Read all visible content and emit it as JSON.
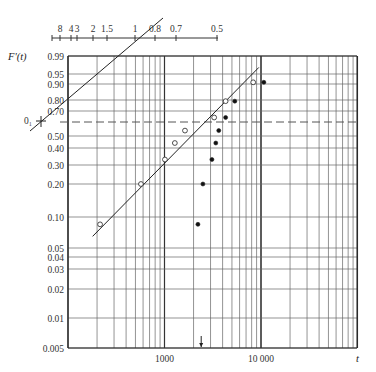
{
  "chart_data": {
    "type": "scatter",
    "title": "",
    "ylabel": "F'(t)",
    "xlabel": "t",
    "xscale": "log",
    "yscale": "probability",
    "xlim": [
      100,
      100000
    ],
    "ylim": [
      0.005,
      0.99
    ],
    "x_tick_labels": [
      {
        "value": 1000,
        "label": "1000"
      },
      {
        "value": 10000,
        "label": "10 000"
      }
    ],
    "y_tick_labels": [
      {
        "value": 0.99,
        "label": "0.99"
      },
      {
        "value": 0.95,
        "label": "0.95"
      },
      {
        "value": 0.9,
        "label": "0.90"
      },
      {
        "value": 0.8,
        "label": "0.80"
      },
      {
        "value": 0.7,
        "label": "0.70"
      },
      {
        "value": 0.5,
        "label": "0.50"
      },
      {
        "value": 0.4,
        "label": "0.40"
      },
      {
        "value": 0.3,
        "label": "0.30"
      },
      {
        "value": 0.2,
        "label": "0.20"
      },
      {
        "value": 0.1,
        "label": "0.10"
      },
      {
        "value": 0.05,
        "label": "0.05"
      },
      {
        "value": 0.04,
        "label": "0.04"
      },
      {
        "value": 0.03,
        "label": "0.03"
      },
      {
        "value": 0.02,
        "label": "0.02"
      },
      {
        "value": 0.01,
        "label": "0.01"
      },
      {
        "value": 0.005,
        "label": "0.005"
      }
    ],
    "reference_line": {
      "value": 0.632,
      "style": "dashed",
      "marker_label": "0₁"
    },
    "shape_scale": {
      "labels": [
        "8",
        "4",
        "3",
        "2",
        "1.5",
        "1",
        "0.8",
        "0.7",
        "0.5"
      ],
      "values": [
        8,
        4,
        3,
        2,
        1.5,
        1,
        0.8,
        0.7,
        0.5
      ]
    },
    "series": [
      {
        "name": "open-circles",
        "marker": "open",
        "points": [
          {
            "t": 215,
            "F": 0.085
          },
          {
            "t": 570,
            "F": 0.2
          },
          {
            "t": 1010,
            "F": 0.33
          },
          {
            "t": 1280,
            "F": 0.44
          },
          {
            "t": 1630,
            "F": 0.55
          },
          {
            "t": 3270,
            "F": 0.66
          },
          {
            "t": 4300,
            "F": 0.79
          },
          {
            "t": 8300,
            "F": 0.91
          }
        ]
      },
      {
        "name": "filled-circles",
        "marker": "filled",
        "points": [
          {
            "t": 2220,
            "F": 0.085
          },
          {
            "t": 2500,
            "F": 0.2
          },
          {
            "t": 3100,
            "F": 0.33
          },
          {
            "t": 3400,
            "F": 0.44
          },
          {
            "t": 3650,
            "F": 0.55
          },
          {
            "t": 4300,
            "F": 0.66
          },
          {
            "t": 5350,
            "F": 0.79
          },
          {
            "t": 10700,
            "F": 0.91
          }
        ]
      }
    ],
    "fitted_line": {
      "from": {
        "t": 180,
        "F": 0.065
      },
      "to": {
        "t": 9500,
        "F": 0.97
      }
    },
    "estimation_line": {
      "note": "parallel line through origin point 0₁ used to read shape parameter on top scale"
    },
    "arrow_marker": {
      "t": 2400,
      "direction": "down"
    },
    "grid": true
  }
}
